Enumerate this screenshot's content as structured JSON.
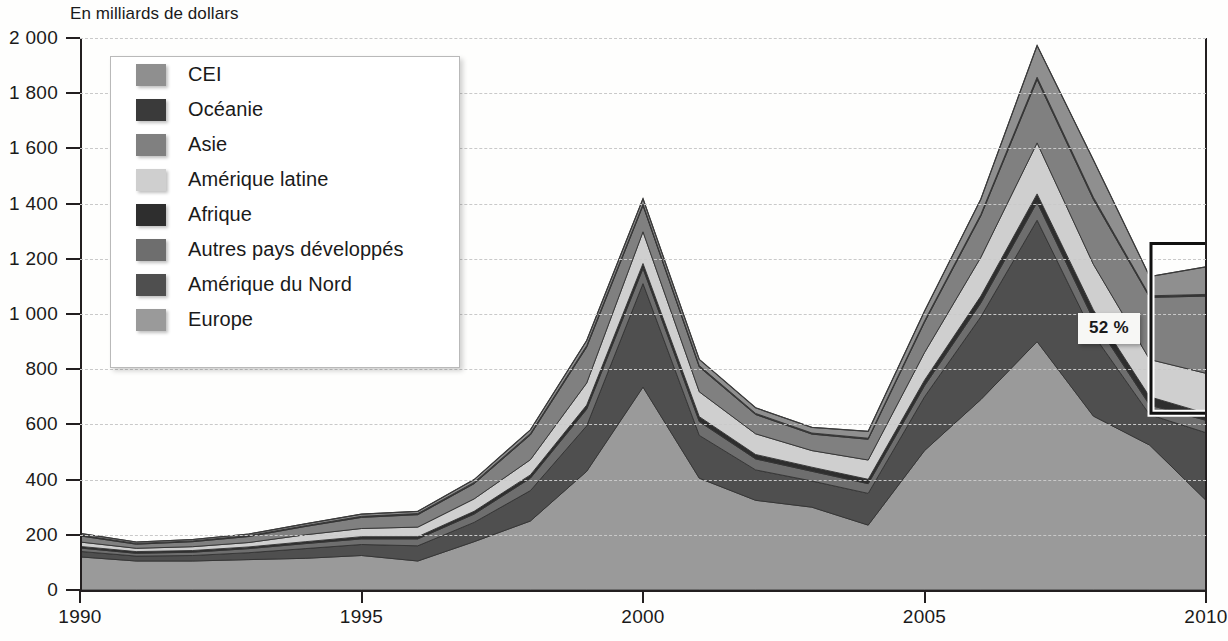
{
  "axis_title": "En milliards de dollars",
  "callout": {
    "label": "52 %"
  },
  "legend": {
    "items": [
      {
        "label": "CEI",
        "color": "#8f8f8f"
      },
      {
        "label": "Océanie",
        "color": "#3a3a3a"
      },
      {
        "label": "Asie",
        "color": "#808080"
      },
      {
        "label": "Amérique latine",
        "color": "#cfcfcf"
      },
      {
        "label": "Afrique",
        "color": "#2e2e2e"
      },
      {
        "label": "Autres pays développés",
        "color": "#6e6e6e"
      },
      {
        "label": "Amérique du Nord",
        "color": "#4f4f4f"
      },
      {
        "label": "Europe",
        "color": "#9a9a9a"
      }
    ]
  },
  "chart_data": {
    "type": "area",
    "stacked": true,
    "title": "",
    "subtitle": "",
    "xlabel": "",
    "ylabel": "En milliards de dollars",
    "xlim": [
      1990,
      2010
    ],
    "ylim": [
      0,
      2000
    ],
    "yticks": [
      0,
      200,
      400,
      600,
      800,
      1000,
      1200,
      1400,
      1600,
      1800,
      2000
    ],
    "ytick_labels": [
      "0",
      "200",
      "400",
      "600",
      "800",
      "1 000",
      "1 200",
      "1 400",
      "1 600",
      "1 800",
      "2 000"
    ],
    "xticks": [
      1990,
      1995,
      2000,
      2005,
      2010
    ],
    "xtick_labels": [
      "1990",
      "1995",
      "2000",
      "2005",
      "2010"
    ],
    "grid": true,
    "grid_style": "dashed-horizontal",
    "legend_position": "upper-left-inset",
    "x": [
      1990,
      1991,
      1992,
      1993,
      1994,
      1995,
      1996,
      1997,
      1998,
      1999,
      2000,
      2001,
      2002,
      2003,
      2004,
      2005,
      2006,
      2007,
      2008,
      2009,
      2010
    ],
    "series": [
      {
        "name": "Europe",
        "color": "#9a9a9a",
        "values": [
          120,
          105,
          105,
          110,
          115,
          125,
          105,
          175,
          250,
          430,
          735,
          405,
          325,
          300,
          235,
          505,
          690,
          900,
          630,
          525,
          325
        ]
      },
      {
        "name": "Amérique du Nord",
        "color": "#4f4f4f",
        "values": [
          20,
          18,
          20,
          25,
          35,
          40,
          55,
          70,
          110,
          165,
          375,
          155,
          110,
          95,
          115,
          195,
          300,
          440,
          295,
          110,
          245
        ]
      },
      {
        "name": "Autres pays développés",
        "color": "#6e6e6e",
        "values": [
          12,
          10,
          12,
          15,
          18,
          20,
          25,
          30,
          45,
          60,
          55,
          50,
          40,
          35,
          35,
          40,
          50,
          65,
          55,
          35,
          45
        ]
      },
      {
        "name": "Afrique",
        "color": "#2e2e2e",
        "values": [
          6,
          6,
          6,
          6,
          7,
          8,
          8,
          10,
          12,
          15,
          18,
          18,
          16,
          15,
          16,
          20,
          25,
          30,
          35,
          30,
          25
        ]
      },
      {
        "name": "Amérique latine",
        "color": "#cfcfcf",
        "values": [
          16,
          12,
          14,
          16,
          25,
          30,
          35,
          45,
          55,
          80,
          115,
          90,
          75,
          60,
          70,
          100,
          140,
          185,
          165,
          135,
          145
        ]
      },
      {
        "name": "Asie",
        "color": "#808080",
        "values": [
          22,
          15,
          18,
          22,
          30,
          40,
          45,
          55,
          90,
          130,
          95,
          90,
          70,
          60,
          75,
          110,
          150,
          230,
          235,
          225,
          280
        ]
      },
      {
        "name": "Océanie",
        "color": "#3a3a3a",
        "values": [
          3,
          3,
          3,
          3,
          3,
          4,
          4,
          5,
          5,
          6,
          5,
          5,
          4,
          4,
          4,
          5,
          6,
          8,
          8,
          6,
          6
        ]
      },
      {
        "name": "CEI",
        "color": "#8f8f8f",
        "values": [
          6,
          5,
          5,
          6,
          7,
          8,
          8,
          10,
          13,
          18,
          20,
          22,
          20,
          20,
          25,
          35,
          55,
          115,
          135,
          70,
          100
        ]
      }
    ],
    "totals": [
      205,
      174,
      183,
      203,
      240,
      275,
      285,
      400,
      580,
      904,
      1418,
      835,
      660,
      589,
      575,
      1010,
      1416,
      1973,
      1558,
      1136,
      1171
    ],
    "annotations": [
      {
        "text": "52 %",
        "x": 2010,
        "type": "bracket",
        "span_from": 640,
        "span_to": 1255,
        "note": "bracket on right edge marking share of 2010 total"
      }
    ]
  }
}
